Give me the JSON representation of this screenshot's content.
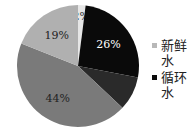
{
  "chart_data": {
    "type": "pie",
    "title": "",
    "slices": [
      {
        "label": "",
        "value": 2,
        "text": "2%",
        "color": "#e6e6e6",
        "text_color": "#333333"
      },
      {
        "label": "循环水",
        "value": 26,
        "text": "26%",
        "color": "#0a0a0a",
        "text_color": "#ffffff"
      },
      {
        "label": "",
        "value": 9,
        "text": "",
        "color": "#2a2a2a",
        "text_color": "#ffffff"
      },
      {
        "label": "",
        "value": 44,
        "text": "44%",
        "color": "#7a7a7a",
        "text_color": "#222222"
      },
      {
        "label": "新鲜水",
        "value": 19,
        "text": "19%",
        "color": "#b0b0b0",
        "text_color": "#222222"
      }
    ],
    "legend": [
      {
        "label": "新鲜水",
        "color": "#b8b8b8"
      },
      {
        "label": "循环水",
        "color": "#0a0a0a"
      }
    ],
    "legend_position": "right"
  }
}
